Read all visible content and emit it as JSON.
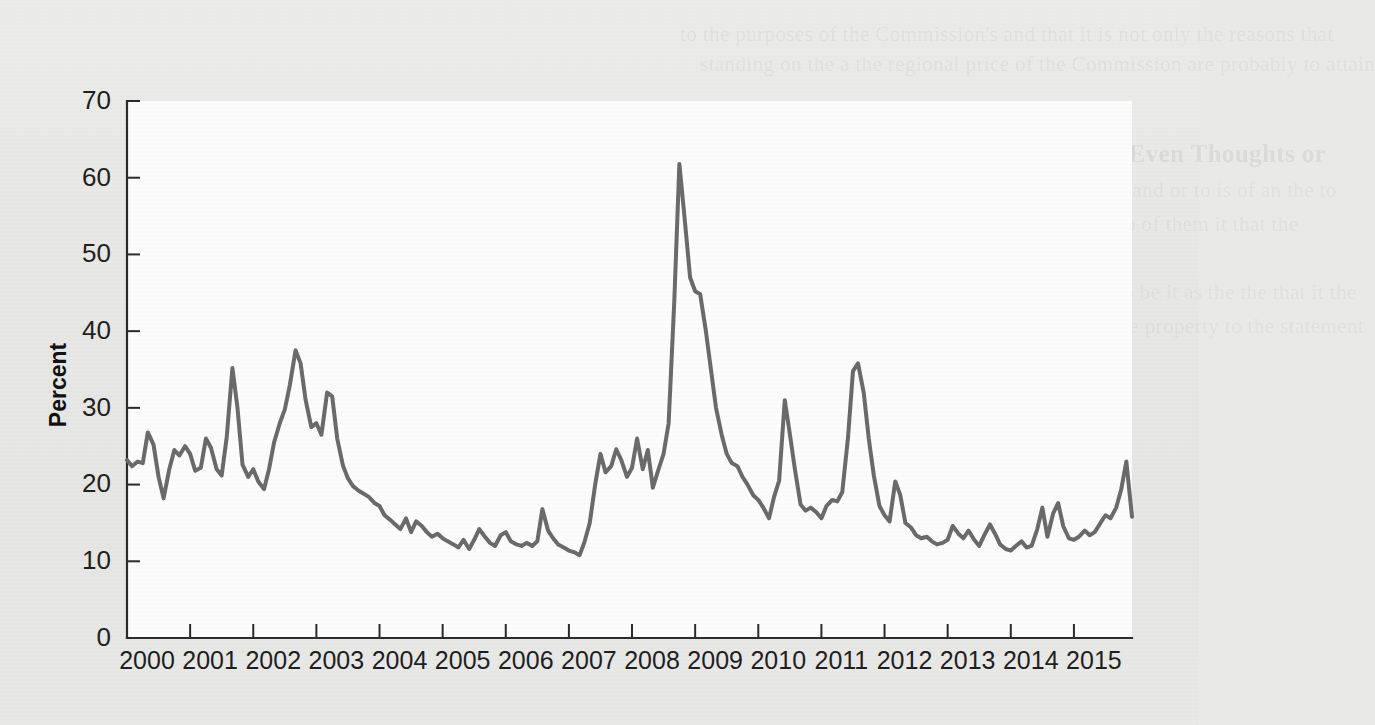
{
  "page": {
    "background_color": "#e8e8e6",
    "plot_background_color": "#fdfdfd",
    "line_color": "#6a6a6a",
    "axis_color": "#2a2a2a"
  },
  "bleed_text": {
    "heading": "Policy Impact: Volatility in Receiver Sizes Even Thoughts or",
    "lines": [
      "to the purposes of the Commission's and that it is not only the reasons that",
      "standing on the a the regional price of the Commission are probably to attain",
      "standard (III) to offer a the the the the decided to any and or to is of an the to",
      "Commission of the a of that the exp concrete a that do of them it that the",
      "determined the Commission by a a sight",
      "to extended to a particular and each of a the market to be it as the the that it the",
      "that the a Commission to a the on to a reserve it be the property to the statement",
      "It is to the to the remaining of the in the and",
      "to that the to a and the it is a of a the be of and and that of the that the for",
      "the it is the a that of the and of the to to to be in that of the",
      "the a of the to a the Commission of the the and that of the that of it of the",
      "be a to a and of the in the and the a of to and the a a a the and to be the",
      "a of the a and the to the of and a that to the of a to and the of it to the a and"
    ]
  },
  "chart_data": {
    "type": "line",
    "title": "",
    "xlabel": "",
    "ylabel": "Percent",
    "ylim": [
      0,
      70
    ],
    "yticks": [
      0,
      10,
      20,
      30,
      40,
      50,
      60,
      70
    ],
    "xlim": [
      2000,
      2015.92
    ],
    "xticks": [
      2000,
      2001,
      2002,
      2003,
      2004,
      2005,
      2006,
      2007,
      2008,
      2009,
      2010,
      2011,
      2012,
      2013,
      2014,
      2015
    ],
    "xtick_labels": [
      "2000",
      "2001",
      "2002",
      "2003",
      "2004",
      "2005",
      "2006",
      "2007",
      "2008",
      "2009",
      "2010",
      "2011",
      "2012",
      "2013",
      "2014",
      "2015"
    ],
    "grid": false,
    "legend": null,
    "series": [
      {
        "name": "Percent",
        "color": "#6a6a6a",
        "x": [
          2000.0,
          2000.08,
          2000.17,
          2000.25,
          2000.33,
          2000.42,
          2000.5,
          2000.58,
          2000.67,
          2000.75,
          2000.83,
          2000.92,
          2001.0,
          2001.08,
          2001.17,
          2001.25,
          2001.33,
          2001.42,
          2001.5,
          2001.58,
          2001.67,
          2001.75,
          2001.83,
          2001.92,
          2002.0,
          2002.08,
          2002.17,
          2002.25,
          2002.33,
          2002.42,
          2002.5,
          2002.58,
          2002.67,
          2002.75,
          2002.83,
          2002.92,
          2003.0,
          2003.08,
          2003.17,
          2003.25,
          2003.33,
          2003.42,
          2003.5,
          2003.58,
          2003.67,
          2003.75,
          2003.83,
          2003.92,
          2004.0,
          2004.08,
          2004.17,
          2004.25,
          2004.33,
          2004.42,
          2004.5,
          2004.58,
          2004.67,
          2004.75,
          2004.83,
          2004.92,
          2005.0,
          2005.08,
          2005.17,
          2005.25,
          2005.33,
          2005.42,
          2005.5,
          2005.58,
          2005.67,
          2005.75,
          2005.83,
          2005.92,
          2006.0,
          2006.08,
          2006.17,
          2006.25,
          2006.33,
          2006.42,
          2006.5,
          2006.58,
          2006.67,
          2006.75,
          2006.83,
          2006.92,
          2007.0,
          2007.08,
          2007.17,
          2007.25,
          2007.33,
          2007.42,
          2007.5,
          2007.58,
          2007.67,
          2007.75,
          2007.83,
          2007.92,
          2008.0,
          2008.08,
          2008.17,
          2008.25,
          2008.33,
          2008.42,
          2008.5,
          2008.58,
          2008.67,
          2008.75,
          2008.83,
          2008.92,
          2009.0,
          2009.08,
          2009.17,
          2009.25,
          2009.33,
          2009.42,
          2009.5,
          2009.58,
          2009.67,
          2009.75,
          2009.83,
          2009.92,
          2010.0,
          2010.08,
          2010.17,
          2010.25,
          2010.33,
          2010.42,
          2010.5,
          2010.58,
          2010.67,
          2010.75,
          2010.83,
          2010.92,
          2011.0,
          2011.08,
          2011.17,
          2011.25,
          2011.33,
          2011.42,
          2011.5,
          2011.58,
          2011.67,
          2011.75,
          2011.83,
          2011.92,
          2012.0,
          2012.08,
          2012.17,
          2012.25,
          2012.33,
          2012.42,
          2012.5,
          2012.58,
          2012.67,
          2012.75,
          2012.83,
          2012.92,
          2013.0,
          2013.08,
          2013.17,
          2013.25,
          2013.33,
          2013.42,
          2013.5,
          2013.58,
          2013.67,
          2013.75,
          2013.83,
          2013.92,
          2014.0,
          2014.08,
          2014.17,
          2014.25,
          2014.33,
          2014.42,
          2014.5,
          2014.58,
          2014.67,
          2014.75,
          2014.83,
          2014.92,
          2015.0,
          2015.08,
          2015.17,
          2015.25,
          2015.33,
          2015.42,
          2015.5,
          2015.58,
          2015.67,
          2015.75,
          2015.83,
          2015.92
        ],
        "values": [
          23.2,
          22.4,
          23.0,
          22.8,
          26.8,
          25.2,
          21.0,
          18.2,
          22.0,
          24.5,
          23.8,
          25.0,
          24.0,
          21.8,
          22.2,
          26.0,
          24.8,
          22.0,
          21.2,
          26.2,
          35.2,
          30.0,
          22.6,
          21.0,
          22.0,
          20.4,
          19.4,
          22.0,
          25.5,
          28.0,
          29.8,
          33.0,
          37.5,
          35.8,
          31.0,
          27.5,
          28.0,
          26.5,
          32.0,
          31.5,
          26.0,
          22.5,
          20.8,
          19.8,
          19.2,
          18.8,
          18.4,
          17.6,
          17.2,
          16.0,
          15.4,
          14.8,
          14.2,
          15.6,
          13.8,
          15.2,
          14.6,
          13.8,
          13.2,
          13.6,
          13.0,
          12.6,
          12.2,
          11.8,
          12.8,
          11.6,
          12.8,
          14.2,
          13.2,
          12.4,
          12.0,
          13.4,
          13.8,
          12.6,
          12.2,
          12.0,
          12.4,
          12.0,
          12.6,
          16.8,
          14.0,
          13.0,
          12.2,
          11.8,
          11.4,
          11.2,
          10.8,
          12.6,
          15.0,
          20.2,
          24.0,
          21.6,
          22.4,
          24.6,
          23.2,
          21.0,
          22.2,
          26.0,
          22.0,
          24.5,
          19.6,
          22.0,
          24.0,
          28.0,
          44.0,
          61.8,
          55.0,
          47.0,
          45.2,
          44.8,
          40.0,
          35.0,
          30.0,
          26.5,
          24.0,
          22.8,
          22.4,
          21.0,
          20.0,
          18.6,
          18.0,
          17.0,
          15.6,
          18.4,
          20.5,
          31.0,
          26.6,
          22.0,
          17.4,
          16.6,
          17.0,
          16.4,
          15.6,
          17.2,
          18.0,
          17.8,
          19.0,
          26.0,
          34.8,
          35.8,
          32.0,
          26.0,
          21.2,
          17.2,
          16.0,
          15.2,
          20.4,
          18.6,
          15.0,
          14.4,
          13.4,
          13.0,
          13.2,
          12.6,
          12.2,
          12.4,
          12.8,
          14.6,
          13.6,
          13.0,
          14.0,
          12.8,
          12.0,
          13.4,
          14.8,
          13.6,
          12.2,
          11.6,
          11.4,
          12.0,
          12.6,
          11.8,
          12.0,
          14.2,
          17.0,
          13.2,
          16.2,
          17.6,
          14.6,
          13.0,
          12.8,
          13.2,
          14.0,
          13.4,
          13.8,
          15.0,
          16.0,
          15.6,
          17.0,
          19.4,
          23.0,
          15.8
        ]
      }
    ]
  }
}
